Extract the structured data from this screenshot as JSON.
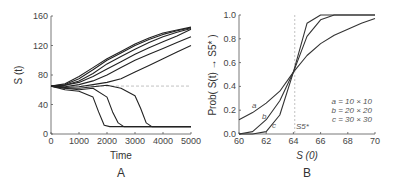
{
  "chart_data": [
    {
      "type": "line",
      "panel": "A",
      "title": "",
      "xlabel": "Time",
      "ylabel": "S (t)",
      "xlim": [
        0,
        5000
      ],
      "ylim": [
        0,
        160
      ],
      "xticks": [
        "0",
        "1000",
        "2000",
        "3000",
        "4000",
        "5000"
      ],
      "yticks": [
        "0",
        "40",
        "80",
        "120",
        "160"
      ],
      "reference_line": {
        "y": 65,
        "style": "dashed"
      },
      "series": [
        {
          "name": "up1",
          "x": [
            0,
            500,
            1000,
            1500,
            2000,
            2500,
            3000,
            3500,
            4000,
            4500,
            5000
          ],
          "values": [
            65,
            68,
            78,
            90,
            102,
            112,
            122,
            130,
            137,
            141,
            145
          ]
        },
        {
          "name": "up2",
          "x": [
            0,
            500,
            1000,
            1500,
            2000,
            2500,
            3000,
            3500,
            4000,
            4500,
            5000
          ],
          "values": [
            65,
            67,
            75,
            87,
            100,
            110,
            120,
            128,
            135,
            140,
            144
          ]
        },
        {
          "name": "up3",
          "x": [
            0,
            500,
            1000,
            1500,
            2000,
            2500,
            3000,
            3500,
            4000,
            4500,
            5000
          ],
          "values": [
            65,
            66,
            72,
            82,
            95,
            105,
            115,
            124,
            132,
            138,
            143
          ]
        },
        {
          "name": "up4",
          "x": [
            0,
            500,
            1000,
            1500,
            2000,
            2500,
            3000,
            3500,
            4000,
            4500,
            5000
          ],
          "values": [
            65,
            66,
            70,
            78,
            88,
            98,
            108,
            117,
            125,
            133,
            142
          ]
        },
        {
          "name": "up5",
          "x": [
            0,
            500,
            1000,
            1500,
            2000,
            2500,
            3000,
            3500,
            4000,
            4500,
            5000
          ],
          "values": [
            65,
            64,
            67,
            72,
            80,
            90,
            100,
            108,
            116,
            124,
            132
          ]
        },
        {
          "name": "up6",
          "x": [
            0,
            500,
            1000,
            1500,
            2000,
            2500,
            3000,
            3500,
            4000,
            4500,
            5000
          ],
          "values": [
            65,
            63,
            64,
            67,
            70,
            75,
            84,
            93,
            102,
            111,
            120
          ]
        },
        {
          "name": "down1",
          "x": [
            0,
            500,
            1000,
            1500,
            1700,
            1900,
            2100,
            2500,
            3000,
            4000,
            5000
          ],
          "values": [
            65,
            60,
            58,
            50,
            30,
            12,
            10,
            10,
            10,
            10,
            10
          ]
        },
        {
          "name": "down2",
          "x": [
            0,
            500,
            1000,
            1500,
            2000,
            2200,
            2400,
            2600,
            3000,
            4000,
            5000
          ],
          "values": [
            65,
            62,
            60,
            62,
            50,
            30,
            15,
            10,
            10,
            10,
            10
          ]
        },
        {
          "name": "down3",
          "x": [
            0,
            500,
            1000,
            1500,
            2000,
            2500,
            3000,
            3200,
            3400,
            3600,
            4000,
            5000
          ],
          "values": [
            65,
            62,
            62,
            64,
            66,
            62,
            52,
            35,
            15,
            10,
            10,
            10
          ]
        }
      ]
    },
    {
      "type": "line",
      "panel": "B",
      "title": "",
      "xlabel": "S (0)",
      "ylabel": "Prob( S(t) → S5* )",
      "xlim": [
        60,
        70
      ],
      "ylim": [
        0,
        1.0
      ],
      "xticks": [
        "60",
        "62",
        "64",
        "66",
        "68",
        "70"
      ],
      "yticks": [
        "0.0",
        "0.2",
        "0.4",
        "0.6",
        "0.8",
        "1.0"
      ],
      "reference_line": {
        "x": 64.1,
        "style": "dashed",
        "label": "S5*"
      },
      "legend": [
        "a = 10 × 10",
        "b = 20 × 20",
        "c = 30 × 30"
      ],
      "series": [
        {
          "name": "a = 10 × 10",
          "x": [
            60,
            61,
            62,
            63,
            64,
            65,
            66,
            67,
            68,
            69,
            70
          ],
          "values": [
            0.12,
            0.18,
            0.26,
            0.36,
            0.52,
            0.66,
            0.76,
            0.83,
            0.88,
            0.93,
            0.97
          ]
        },
        {
          "name": "b = 20 × 20",
          "x": [
            60,
            61,
            62,
            63,
            64,
            65,
            66,
            67,
            68,
            69,
            70
          ],
          "values": [
            0.0,
            0.02,
            0.12,
            0.28,
            0.52,
            0.82,
            0.96,
            1.0,
            1.0,
            1.0,
            1.0
          ]
        },
        {
          "name": "c = 30 × 30",
          "x": [
            60,
            61,
            62,
            63,
            64,
            65,
            66,
            67,
            68,
            69,
            70
          ],
          "values": [
            0.0,
            0.0,
            0.02,
            0.16,
            0.52,
            0.93,
            1.0,
            1.0,
            1.0,
            1.0,
            1.0
          ]
        }
      ]
    }
  ],
  "labels": {
    "panelA": "A",
    "panelB": "B",
    "axisA_x": "Time",
    "axisA_y": "S (t)",
    "axisB_x": "S (0)",
    "axisB_y": "Prob( S(t) → S5* )",
    "legend_a": "a = 10 × 10",
    "legend_b": "b = 20 × 20",
    "legend_c": "c = 30 × 30",
    "curve_a": "a",
    "curve_b": "b",
    "curve_c": "c",
    "ref_label": "S5*"
  }
}
